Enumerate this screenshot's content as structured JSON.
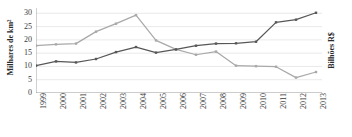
{
  "chart_data": {
    "type": "line",
    "title": "",
    "subtitle": "",
    "xlabel": "",
    "ylabel": "Milhares de km²",
    "ylabel_right": "Bilhões R$",
    "ylim": [
      0,
      32
    ],
    "yticks": [
      0,
      5,
      10,
      15,
      20,
      25,
      30
    ],
    "grid": true,
    "grid_axis": "y",
    "legend": "none",
    "categories": [
      "1999",
      "2000",
      "2001",
      "2002",
      "2003",
      "2004",
      "2005",
      "2006",
      "2007",
      "2008",
      "2009",
      "2010",
      "2011",
      "2012",
      "2013"
    ],
    "series": [
      {
        "name": "Bilhões R$",
        "color": "#a9a9a9",
        "marker": "square",
        "values": [
          17.8,
          18.3,
          18.6,
          23.1,
          26.1,
          29.3,
          19.8,
          16.4,
          14.4,
          15.6,
          10.3,
          10.1,
          9.9,
          5.8,
          7.9
        ]
      },
      {
        "name": "Milhares de km²",
        "color": "#585858",
        "marker": "square",
        "values": [
          10.3,
          11.9,
          11.5,
          12.8,
          15.4,
          17.3,
          15.2,
          16.4,
          17.8,
          18.6,
          18.7,
          19.3,
          26.6,
          27.6,
          30.2
        ]
      }
    ]
  },
  "axis": {
    "left_title": "Milhares de km²",
    "right_title": "Bilhões R$",
    "ytick_labels": [
      "30",
      "25",
      "20",
      "15",
      "10",
      "5",
      "0"
    ],
    "xtick_labels": [
      "1999",
      "2000",
      "2001",
      "2002",
      "2003",
      "2004",
      "2005",
      "2006",
      "2007",
      "2008",
      "2009",
      "2010",
      "2011",
      "2012",
      "2013"
    ]
  },
  "style": {
    "grid_color": "#e3e3e3",
    "axis_line_color": "#9a9a9a",
    "series_light": "#a9a9a9",
    "series_dark": "#585858",
    "background": "#ffffff"
  }
}
